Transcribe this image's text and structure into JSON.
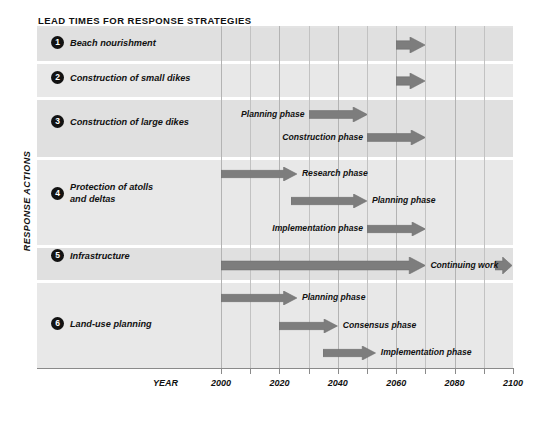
{
  "title": "LEAD TIMES FOR RESPONSE STRATEGIES",
  "y_axis_caption": "RESPONSE ACTIONS",
  "x_axis_title": "YEAR",
  "colors": {
    "arrow": "#7d7d7d",
    "arrow_dark": "#6e6e6e",
    "arrow_light": "#9a9a9a",
    "panel": "#e3e3e3",
    "band": "#e0e0e0",
    "band_alt": "#e8e8e8",
    "grid": "#c2c2c2",
    "text": "#111111",
    "bullet_bg": "#121212",
    "bullet_fg": "#ffffff"
  },
  "axis": {
    "ticks": [
      2000,
      2010,
      2020,
      2030,
      2040,
      2050,
      2060,
      2070,
      2080,
      2090,
      2100
    ],
    "labelled_ticks": [
      2000,
      2020,
      2040,
      2060,
      2080,
      2100
    ],
    "labels": [
      "2000",
      "2020",
      "2040",
      "2060",
      "2080",
      "2100"
    ],
    "min": 2000,
    "max": 2100
  },
  "rows": [
    {
      "number": "1",
      "label": "Beach nourishment"
    },
    {
      "number": "2",
      "label": "Construction of small dikes"
    },
    {
      "number": "3",
      "label": "Construction of large dikes"
    },
    {
      "number": "4",
      "label": "Protection of atolls\nand deltas"
    },
    {
      "number": "5",
      "label": "Infrastructure"
    },
    {
      "number": "6",
      "label": "Land-use planning"
    }
  ],
  "bars": [
    {
      "row": 1,
      "label": "",
      "label_side": "none",
      "start": 2060,
      "end": 2070,
      "continuing": false
    },
    {
      "row": 2,
      "label": "",
      "label_side": "none",
      "start": 2060,
      "end": 2070,
      "continuing": false
    },
    {
      "row": 3,
      "label": "Planning phase",
      "label_side": "left",
      "start": 2030,
      "end": 2050,
      "continuing": false
    },
    {
      "row": 3,
      "label": "Construction phase",
      "label_side": "left",
      "start": 2050,
      "end": 2070,
      "continuing": false
    },
    {
      "row": 4,
      "label": "Research phase",
      "label_side": "right",
      "start": 2000,
      "end": 2026,
      "continuing": false
    },
    {
      "row": 4,
      "label": "Planning phase",
      "label_side": "right",
      "start": 2024,
      "end": 2050,
      "continuing": false
    },
    {
      "row": 4,
      "label": "Implementation phase",
      "label_side": "left",
      "start": 2050,
      "end": 2070,
      "continuing": false
    },
    {
      "row": 5,
      "label": "Continuing work",
      "label_side": "right",
      "start": 2000,
      "end": 2070,
      "continuing": true
    },
    {
      "row": 6,
      "label": "Planning phase",
      "label_side": "right",
      "start": 2000,
      "end": 2026,
      "continuing": false
    },
    {
      "row": 6,
      "label": "Consensus phase",
      "label_side": "right",
      "start": 2020,
      "end": 2040,
      "continuing": false
    },
    {
      "row": 6,
      "label": "Implementation phase",
      "label_side": "right",
      "start": 2035,
      "end": 2053,
      "continuing": false
    },
    {
      "row": 6,
      "label": "Natural restoration phase",
      "label_side": "left",
      "start": 2048,
      "end": 2070,
      "continuing": true
    }
  ],
  "chart_data": {
    "type": "bar",
    "title": "LEAD TIMES FOR RESPONSE STRATEGIES",
    "xlabel": "YEAR",
    "ylabel": "RESPONSE ACTIONS",
    "xlim": [
      2000,
      2100
    ],
    "grid": true,
    "legend": "none",
    "orientation": "horizontal-gantt",
    "categories": [
      "1 Beach nourishment",
      "2 Construction of small dikes",
      "3 Construction of large dikes",
      "4 Protection of atolls and deltas",
      "5 Infrastructure",
      "6 Land-use planning"
    ],
    "series": [
      {
        "name": "Beach nourishment",
        "phase": "",
        "start": 2060,
        "end": 2070
      },
      {
        "name": "Construction of small dikes",
        "phase": "",
        "start": 2060,
        "end": 2070
      },
      {
        "name": "Construction of large dikes",
        "phase": "Planning phase",
        "start": 2030,
        "end": 2050
      },
      {
        "name": "Construction of large dikes",
        "phase": "Construction phase",
        "start": 2050,
        "end": 2070
      },
      {
        "name": "Protection of atolls and deltas",
        "phase": "Research phase",
        "start": 2000,
        "end": 2026
      },
      {
        "name": "Protection of atolls and deltas",
        "phase": "Planning phase",
        "start": 2024,
        "end": 2050
      },
      {
        "name": "Protection of atolls and deltas",
        "phase": "Implementation phase",
        "start": 2050,
        "end": 2070
      },
      {
        "name": "Infrastructure",
        "phase": "Continuing work",
        "start": 2000,
        "end": 2070,
        "continues_beyond": true
      },
      {
        "name": "Land-use planning",
        "phase": "Planning phase",
        "start": 2000,
        "end": 2026
      },
      {
        "name": "Land-use planning",
        "phase": "Consensus phase",
        "start": 2020,
        "end": 2040
      },
      {
        "name": "Land-use planning",
        "phase": "Implementation phase",
        "start": 2035,
        "end": 2053
      },
      {
        "name": "Land-use planning",
        "phase": "Natural restoration phase",
        "start": 2048,
        "end": 2070,
        "continues_beyond": true
      }
    ],
    "xticks": [
      2000,
      2020,
      2040,
      2060,
      2080,
      2100
    ],
    "minor_xticks": [
      2010,
      2030,
      2050,
      2070,
      2090
    ]
  }
}
